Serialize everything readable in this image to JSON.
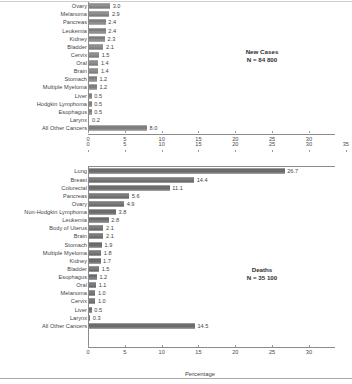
{
  "figure": {
    "axis_title": "Percentage",
    "xticks": [
      0,
      5,
      10,
      15,
      20,
      25,
      30,
      35
    ],
    "xtick_labels": [
      "0",
      "5",
      "10",
      "15",
      "20",
      "25",
      "30",
      "35"
    ],
    "xlim": [
      0,
      33.5
    ]
  },
  "chart_data": [
    {
      "type": "bar",
      "orientation": "horizontal",
      "title": "New Cases",
      "annotation": "N = 84 800",
      "xlabel": "Percentage",
      "ylabel": "",
      "xlim": [
        0,
        33.5
      ],
      "grid": false,
      "legend": "none",
      "note": "Top rows are cropped off the top edge of the screenshot; only rows from Ovary downward are visible.",
      "categories": [
        "Ovary",
        "Melanoma",
        "Pancreas",
        "Leukemia",
        "Kidney",
        "Bladder",
        "Cervix",
        "Oral",
        "Brain",
        "Stomach",
        "Multiple Myeloma",
        "Liver",
        "Hodgkin Lymphoma",
        "Esophagus",
        "Larynx",
        "All Other Cancers"
      ],
      "values": [
        3.0,
        2.9,
        2.4,
        2.4,
        2.3,
        2.1,
        1.5,
        1.4,
        1.4,
        1.2,
        1.2,
        0.5,
        0.5,
        0.5,
        0.2,
        8.0
      ],
      "value_labels": [
        "3.0",
        "2.9",
        "2.4",
        "2.4",
        "2.3",
        "2.1",
        "1.5",
        "1.4",
        "1.4",
        "1.2",
        "1.2",
        "0.5",
        "0.5",
        "0.5",
        "0.2",
        "8.0"
      ]
    },
    {
      "type": "bar",
      "orientation": "horizontal",
      "title": "Deaths",
      "annotation": "N = 35 100",
      "xlabel": "Percentage",
      "ylabel": "",
      "xlim": [
        0,
        33.5
      ],
      "grid": false,
      "legend": "none",
      "categories": [
        "Lung",
        "Breast",
        "Colorectal",
        "Pancreas",
        "Ovary",
        "Non-Hodgkin Lymphoma",
        "Leukemia",
        "Body of Uterus",
        "Brain",
        "Stomach",
        "Multiple Myeloma",
        "Kidney",
        "Bladder",
        "Esophagus",
        "Oral",
        "Melanoma",
        "Cervix",
        "Liver",
        "Larynx",
        "All Other Cancers"
      ],
      "values": [
        26.7,
        14.4,
        11.1,
        5.6,
        4.9,
        3.8,
        2.8,
        2.1,
        2.1,
        1.9,
        1.8,
        1.7,
        1.5,
        1.2,
        1.1,
        1.0,
        1.0,
        0.5,
        0.3,
        14.5
      ],
      "value_labels": [
        "26.7",
        "14.4",
        "11.1",
        "5.6",
        "4.9",
        "3.8",
        "2.8",
        "2.1",
        "2.1",
        "1.9",
        "1.8",
        "1.7",
        "1.5",
        "1.2",
        "1.1",
        "1.0",
        "1.0",
        "0.5",
        "0.3",
        "14.5"
      ]
    }
  ]
}
